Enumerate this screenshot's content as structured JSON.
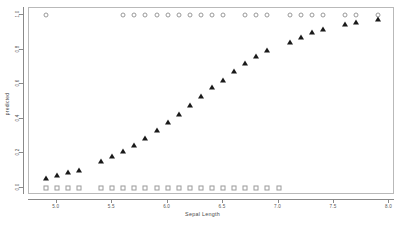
{
  "chart_data": {
    "type": "scatter",
    "title": "",
    "xlabel": "Sepal Length",
    "ylabel": "predicted",
    "xlim": [
      4.75,
      8.05
    ],
    "ylim": [
      -0.04,
      1.04
    ],
    "grid": false,
    "legend": "none",
    "xticks": [
      "5.0",
      "5.5",
      "6.0",
      "6.5",
      "7.0",
      "7.5",
      "8.0"
    ],
    "xtickvalues": [
      5.0,
      5.5,
      6.0,
      6.5,
      7.0,
      7.5,
      8.0
    ],
    "yticks": [
      "0.0",
      "0.2",
      "0.4",
      "0.6",
      "0.8",
      "1.0"
    ],
    "ytickvalues": [
      0.0,
      0.2,
      0.4,
      0.6,
      0.8,
      1.0
    ],
    "series": [
      {
        "name": "observed-class-1",
        "marker": "open-circle",
        "color": "#9a9a9a",
        "x": [
          4.9,
          5.6,
          5.7,
          5.8,
          5.9,
          6.0,
          6.1,
          6.2,
          6.3,
          6.4,
          6.5,
          6.7,
          6.8,
          6.9,
          7.1,
          7.2,
          7.3,
          7.4,
          7.6,
          7.7,
          7.9
        ],
        "y": [
          1,
          1,
          1,
          1,
          1,
          1,
          1,
          1,
          1,
          1,
          1,
          1,
          1,
          1,
          1,
          1,
          1,
          1,
          1,
          1,
          1
        ]
      },
      {
        "name": "observed-class-0",
        "marker": "open-square",
        "color": "#9a9a9a",
        "x": [
          4.9,
          5.0,
          5.1,
          5.2,
          5.4,
          5.5,
          5.6,
          5.7,
          5.8,
          5.9,
          6.0,
          6.1,
          6.2,
          6.3,
          6.4,
          6.5,
          6.6,
          6.7,
          6.8,
          6.9,
          7.0
        ],
        "y": [
          0,
          0,
          0,
          0,
          0,
          0,
          0,
          0,
          0,
          0,
          0,
          0,
          0,
          0,
          0,
          0,
          0,
          0,
          0,
          0,
          0
        ]
      },
      {
        "name": "fitted-probability",
        "marker": "filled-triangle",
        "color": "#1a1a1a",
        "x": [
          4.9,
          5.0,
          5.1,
          5.2,
          5.4,
          5.5,
          5.6,
          5.7,
          5.8,
          5.9,
          6.0,
          6.1,
          6.2,
          6.3,
          6.4,
          6.5,
          6.6,
          6.7,
          6.8,
          6.9,
          7.1,
          7.2,
          7.3,
          7.4,
          7.6,
          7.7,
          7.9
        ],
        "y": [
          0.06,
          0.075,
          0.09,
          0.105,
          0.155,
          0.185,
          0.215,
          0.25,
          0.29,
          0.335,
          0.38,
          0.43,
          0.48,
          0.53,
          0.585,
          0.625,
          0.675,
          0.72,
          0.765,
          0.8,
          0.845,
          0.875,
          0.9,
          0.92,
          0.95,
          0.96,
          0.975
        ]
      }
    ]
  }
}
